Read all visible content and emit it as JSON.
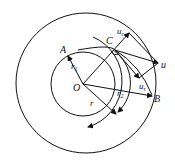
{
  "diagram": {
    "labels": {
      "A": "A",
      "C": "C",
      "O": "O",
      "B": "B",
      "u": "u",
      "uc": "u",
      "uc_sub": "c",
      "ut": "u",
      "ut_sub": "τ",
      "r1": "r",
      "r1_sub": "1",
      "r2": "r",
      "r2_sub": "2",
      "r": "r"
    },
    "colors": {
      "stroke": "#111111",
      "background": "#ffffff"
    }
  }
}
